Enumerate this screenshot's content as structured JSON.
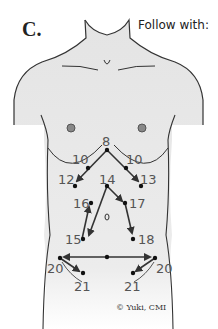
{
  "figure": {
    "label": "C.",
    "instruction": "Follow with:",
    "copyright": "© Yuki, CMI"
  },
  "points": [
    {
      "id": "8",
      "label": "8"
    },
    {
      "id": "10L",
      "label": "10"
    },
    {
      "id": "10R",
      "label": "10"
    },
    {
      "id": "12",
      "label": "12"
    },
    {
      "id": "13",
      "label": "13"
    },
    {
      "id": "14",
      "label": "14"
    },
    {
      "id": "16",
      "label": "16"
    },
    {
      "id": "17",
      "label": "17"
    },
    {
      "id": "15",
      "label": "15"
    },
    {
      "id": "18",
      "label": "18"
    },
    {
      "id": "20L",
      "label": "20"
    },
    {
      "id": "20R",
      "label": "20"
    },
    {
      "id": "21L",
      "label": "21"
    },
    {
      "id": "21R",
      "label": "21"
    }
  ],
  "colors": {
    "body_fill": "#e4e4e4",
    "outline": "#333333",
    "arrow": "#333333",
    "number": "#555555"
  }
}
